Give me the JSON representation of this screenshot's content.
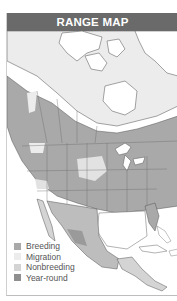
{
  "header": {
    "title": "RANGE MAP"
  },
  "legend": {
    "items": [
      {
        "label": "Breeding",
        "color": "#a9a9a9"
      },
      {
        "label": "Migration",
        "color": "#ececec"
      },
      {
        "label": "Nonbreeding",
        "color": "#d4d4d4"
      },
      {
        "label": "Year-round",
        "color": "#8f8f8f"
      }
    ]
  },
  "colors": {
    "header_bg": "#6a6a6a",
    "land_unoccupied": "#ffffff",
    "breeding": "#a9a9a9",
    "migration": "#ececec",
    "nonbreeding": "#d4d4d4",
    "year_round": "#8f8f8f",
    "border": "#555555"
  },
  "map": {
    "region": "North America"
  }
}
